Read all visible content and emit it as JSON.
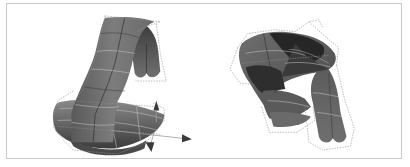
{
  "figure": {
    "panels": [
      {
        "id": "left",
        "description": "Ribbon-like surface mesh bending down into a flared base with control lattice and transform gizmo arrows",
        "elements": [
          "surface-mesh",
          "control-lattice",
          "translate-gizmo"
        ]
      },
      {
        "id": "right",
        "description": "Curled surface mesh wrapped around itself with two lobes hanging down, enclosed by control lattice",
        "elements": [
          "surface-mesh",
          "control-lattice"
        ]
      }
    ],
    "colors": {
      "background": "#ffffff",
      "frame_border": "#c8c8c8",
      "surface_light": "#8a8a8a",
      "surface_mid": "#5e5e5e",
      "surface_dark": "#262626",
      "lattice": "#9a9a9a",
      "mesh_lines": "#d0d0d0"
    }
  }
}
